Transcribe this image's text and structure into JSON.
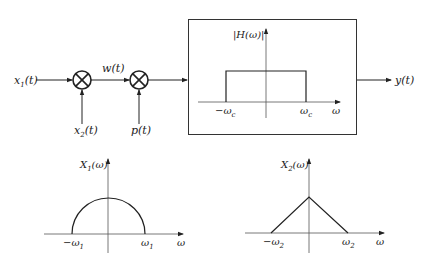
{
  "system": {
    "input1": "x1(t)",
    "input1_main": "x",
    "input1_sub": "1",
    "input1_arg": "(t)",
    "intermediate": "w(t)",
    "input2_main": "x",
    "input2_sub": "2",
    "input2_arg": "(t)",
    "input3": "p(t)",
    "output": "y(t)",
    "multiplier_symbol": "⊗"
  },
  "filter": {
    "ylabel": "|H(ω)|",
    "xlabel": "ω",
    "left_cutoff_main": "−ω",
    "right_cutoff_main": "ω",
    "cutoff_sub": "c"
  },
  "spectrum1": {
    "ylabel_main": "X",
    "ylabel_sub": "1",
    "ylabel_arg": "(ω)",
    "left_main": "−ω",
    "right_main": "ω",
    "edge_sub": "1",
    "xlabel": "ω",
    "shape": "semicircle"
  },
  "spectrum2": {
    "ylabel_main": "X",
    "ylabel_sub": "2",
    "ylabel_arg": "(ω)",
    "left_main": "−ω",
    "right_main": "ω",
    "edge_sub": "2",
    "xlabel": "ω",
    "shape": "triangle"
  }
}
